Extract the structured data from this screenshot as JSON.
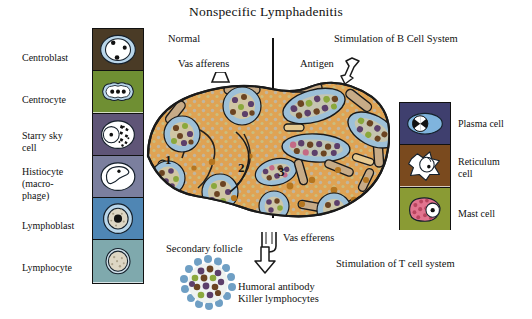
{
  "figure": {
    "title": "Nonspecific Lymphadenitis",
    "captions": {
      "normal": "Normal",
      "b_cell": "Stimulation of B Cell System",
      "t_cell": "Stimulation of T cell system",
      "vas_afferens": "Vas afferens",
      "vas_efferens": "Vas efferens",
      "antigen": "Antigen",
      "secondary_follicle": "Secondary follicle",
      "output": "Humoral antibody\nKiller lymphocytes"
    },
    "node_region_numbers": [
      "1",
      "2",
      "3"
    ]
  },
  "left_panel": {
    "items": [
      {
        "label": "Centroblast",
        "bg": "#4a3b26",
        "icon": "centroblast-cell-icon"
      },
      {
        "label": "Centrocyte",
        "bg": "#6f8f33",
        "icon": "centrocyte-cell-icon"
      },
      {
        "label": "Starry sky\ncell",
        "bg": "#5f5577",
        "icon": "starry-sky-cell-icon"
      },
      {
        "label": "Histiocyte\n(macro-\nphage)",
        "bg": "#7b7f9e",
        "icon": "histiocyte-cell-icon"
      },
      {
        "label": "Lymphoblast",
        "bg": "#4f86b4",
        "icon": "lymphoblast-cell-icon"
      },
      {
        "label": "Lymphocyte",
        "bg": "#7fa9ad",
        "icon": "lymphocyte-cell-icon"
      }
    ]
  },
  "right_panel": {
    "items": [
      {
        "label": "Plasma cell",
        "bg": "#3f3f6e",
        "icon": "plasma-cell-icon"
      },
      {
        "label": "Reticulum\ncell",
        "bg": "#7a4a1e",
        "icon": "reticulum-cell-icon"
      },
      {
        "label": "Mast cell",
        "bg": "#8a9b34",
        "icon": "mast-cell-icon"
      }
    ]
  },
  "colors": {
    "node_fill": "#dfa354",
    "node_outline": "#1a1a1a",
    "sinus_fill": "#c7ab87",
    "follicle_mantle": "#9dc0d8",
    "cell_purple": "#5c3f6b",
    "cell_brown": "#6b4422",
    "cell_olive": "#8aa83c",
    "cell_pink": "#c46a86",
    "paracortex_dot": "#a8c6dd",
    "background": "#ffffff",
    "text": "#111111"
  }
}
